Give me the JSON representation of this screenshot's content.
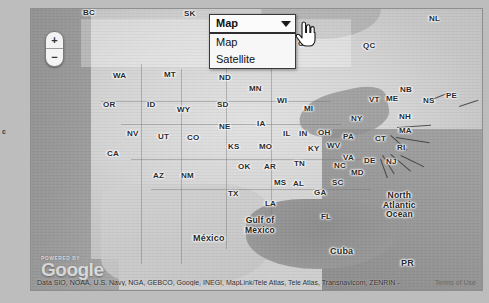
{
  "map": {
    "type_selector": {
      "selected": "Map",
      "options": [
        "Map",
        "Satellite"
      ]
    },
    "zoom_control": {
      "zoom_in_label": "+",
      "zoom_out_label": "−"
    },
    "edge_marker": "c",
    "labels": [
      {
        "text": "BC",
        "x": 82,
        "y": 7
      },
      {
        "text": "SK",
        "x": 183,
        "y": 8
      },
      {
        "text": "ON",
        "x": 297,
        "y": 38
      },
      {
        "text": "QC",
        "x": 362,
        "y": 40
      },
      {
        "text": "NL",
        "x": 428,
        "y": 13
      },
      {
        "text": "WA",
        "x": 112,
        "y": 70
      },
      {
        "text": "MT",
        "x": 163,
        "y": 69
      },
      {
        "text": "ND",
        "x": 218,
        "y": 72
      },
      {
        "text": "OR",
        "x": 102,
        "y": 99
      },
      {
        "text": "ID",
        "x": 146,
        "y": 99
      },
      {
        "text": "WY",
        "x": 176,
        "y": 104
      },
      {
        "text": "SD",
        "x": 216,
        "y": 99
      },
      {
        "text": "MN",
        "x": 248,
        "y": 83
      },
      {
        "text": "WI",
        "x": 276,
        "y": 95
      },
      {
        "text": "MI",
        "x": 303,
        "y": 103
      },
      {
        "text": "NE",
        "x": 218,
        "y": 121
      },
      {
        "text": "IA",
        "x": 256,
        "y": 118
      },
      {
        "text": "NV",
        "x": 126,
        "y": 128
      },
      {
        "text": "UT",
        "x": 157,
        "y": 131
      },
      {
        "text": "CO",
        "x": 186,
        "y": 132
      },
      {
        "text": "KS",
        "x": 227,
        "y": 141
      },
      {
        "text": "MO",
        "x": 258,
        "y": 141
      },
      {
        "text": "IL",
        "x": 282,
        "y": 128
      },
      {
        "text": "IN",
        "x": 298,
        "y": 128
      },
      {
        "text": "OH",
        "x": 317,
        "y": 127
      },
      {
        "text": "PA",
        "x": 342,
        "y": 131
      },
      {
        "text": "NY",
        "x": 350,
        "y": 113
      },
      {
        "text": "VT",
        "x": 368,
        "y": 94
      },
      {
        "text": "ME",
        "x": 385,
        "y": 93
      },
      {
        "text": "NB",
        "x": 399,
        "y": 84
      },
      {
        "text": "NS",
        "x": 422,
        "y": 95
      },
      {
        "text": "PE",
        "x": 445,
        "y": 90
      },
      {
        "text": "NH",
        "x": 398,
        "y": 111
      },
      {
        "text": "MA",
        "x": 398,
        "y": 125
      },
      {
        "text": "CT",
        "x": 374,
        "y": 133
      },
      {
        "text": "RI",
        "x": 396,
        "y": 142
      },
      {
        "text": "KY",
        "x": 307,
        "y": 143
      },
      {
        "text": "WV",
        "x": 326,
        "y": 140
      },
      {
        "text": "VA",
        "x": 342,
        "y": 152
      },
      {
        "text": "DE",
        "x": 363,
        "y": 155
      },
      {
        "text": "NJ",
        "x": 385,
        "y": 156
      },
      {
        "text": "MD",
        "x": 350,
        "y": 167
      },
      {
        "text": "CA",
        "x": 106,
        "y": 148
      },
      {
        "text": "AZ",
        "x": 152,
        "y": 170
      },
      {
        "text": "NM",
        "x": 180,
        "y": 170
      },
      {
        "text": "OK",
        "x": 237,
        "y": 161
      },
      {
        "text": "AR",
        "x": 263,
        "y": 161
      },
      {
        "text": "TN",
        "x": 293,
        "y": 158
      },
      {
        "text": "NC",
        "x": 333,
        "y": 160
      },
      {
        "text": "SC",
        "x": 331,
        "y": 177
      },
      {
        "text": "MS",
        "x": 273,
        "y": 177
      },
      {
        "text": "AL",
        "x": 292,
        "y": 178
      },
      {
        "text": "GA",
        "x": 313,
        "y": 187
      },
      {
        "text": "TX",
        "x": 227,
        "y": 188
      },
      {
        "text": "LA",
        "x": 264,
        "y": 198
      },
      {
        "text": "FL",
        "x": 320,
        "y": 211
      }
    ],
    "place_labels": [
      {
        "text": "México",
        "x": 192,
        "y": 232,
        "class": "country"
      },
      {
        "text": "Cuba",
        "x": 329,
        "y": 245,
        "class": "country"
      },
      {
        "text": "PR",
        "x": 400,
        "y": 257,
        "class": "country"
      }
    ],
    "water_labels": [
      {
        "line1": "Gulf of",
        "line2": "Mexico",
        "x": 262,
        "y": 215
      },
      {
        "line1": "North",
        "line2": "Atlantic",
        "line3": "Ocean",
        "x": 400,
        "y": 190
      }
    ]
  },
  "footer": {
    "powered_by": "POWERED BY",
    "brand": "Google",
    "attribution": "Data SIO, NOAA, U.S. Navy, NGA, GEBCO, Google, INEGI, MapLink/Tele Atlas, Tele Atlas, Transnavicom, ZENRIN -",
    "terms": "Terms of Use"
  },
  "colors": {
    "land": "#d4d4d4",
    "water": "#969696",
    "label_text": "#2a2a2a",
    "dropdown_border": "#3a3a3a"
  }
}
